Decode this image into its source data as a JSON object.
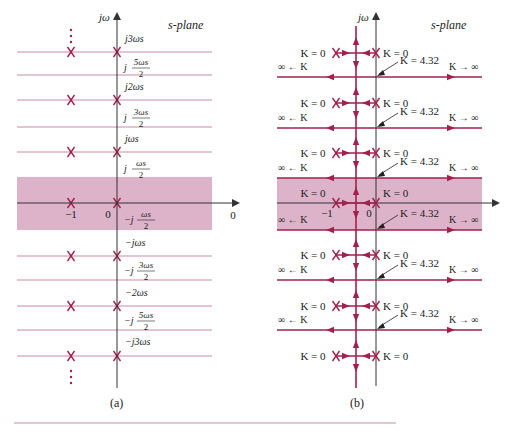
{
  "colors": {
    "locus": "#a3204e",
    "band_fill": "#dcb3c8",
    "band_line": "#a3204e",
    "grid_line": "#c98aa6",
    "axis": "#333333",
    "pole": "#a3204e",
    "text": "#222222",
    "rule": "#c98aa6"
  },
  "panel_a": {
    "caption": "(a)",
    "plane_label": "s-plane",
    "axis_label": "jω",
    "real_labels": {
      "minus_one": "−1",
      "zero": "0",
      "right_zero": "0"
    },
    "pole_rows_y": [
      52,
      100,
      152,
      203,
      256,
      306,
      356
    ],
    "boundary_rows_y": [
      75,
      127,
      280,
      330
    ],
    "band": {
      "top": 177,
      "bottom": 230,
      "left": 17,
      "right": 212
    },
    "freq_labels": [
      {
        "text": "j3ωs",
        "y": 42
      },
      {
        "text": "j 5ωs/2",
        "y": 67,
        "frac": true,
        "pre": "j",
        "num": "5ωs",
        "den": "2"
      },
      {
        "text": "j2ωs",
        "y": 90
      },
      {
        "text": "j 3ωs/2",
        "y": 117,
        "frac": true,
        "pre": "j",
        "num": "3ωs",
        "den": "2"
      },
      {
        "text": "jωs",
        "y": 142
      },
      {
        "text": "j ωs/2",
        "y": 168,
        "frac": true,
        "pre": "j",
        "num": "ωs",
        "den": "2"
      },
      {
        "text": "−j ωs/2",
        "y": 219,
        "frac": true,
        "pre": "−j",
        "num": "ωs",
        "den": "2"
      },
      {
        "text": "−jωs",
        "y": 246
      },
      {
        "text": "−j 3ωs/2",
        "y": 270,
        "frac": true,
        "pre": "−j",
        "num": "3ωs",
        "den": "2"
      },
      {
        "text": "−2ωs",
        "y": 296
      },
      {
        "text": "−j 5ωs/2",
        "y": 320,
        "frac": true,
        "pre": "−j",
        "num": "5ωs",
        "den": "2"
      },
      {
        "text": "−j3ωs",
        "y": 345
      }
    ]
  },
  "panel_b": {
    "caption": "(b)",
    "plane_label": "s-plane",
    "axis_label": "jω",
    "real_labels": {
      "minus_one": "−1",
      "zero": "0"
    },
    "pole_rows_y": [
      53,
      103,
      153,
      203,
      255,
      306,
      356
    ],
    "boundary_rows_y": [
      77,
      128,
      178,
      230,
      280,
      330
    ],
    "band": {
      "top": 178,
      "bottom": 230,
      "left": 277,
      "right": 482
    },
    "labels": {
      "k_zero": "K = 0",
      "k_breakaway": "K = 4.32",
      "k_left_inf": "∞ ← K",
      "k_right_inf": "K → ∞"
    }
  },
  "figure_rule": {
    "y": 423,
    "x1": 14,
    "x2": 396
  }
}
